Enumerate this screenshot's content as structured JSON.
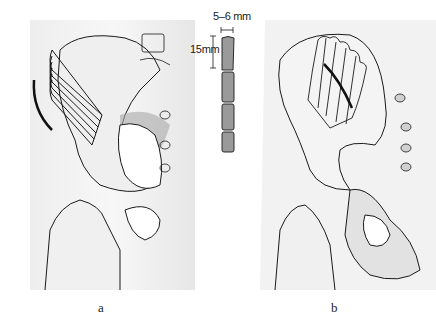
{
  "figure": {
    "panels": [
      {
        "id": "a",
        "label": "a",
        "description": "Posterior view of pelvis with curved strip graft cuts on iliac wing and skin incision"
      },
      {
        "id": "b",
        "label": "b",
        "description": "Lateral view of pelvis with longitudinal strip cuts and crossing line on iliac wing"
      }
    ],
    "dimensions": {
      "width_label": "5–6 mm",
      "height_label": "15mm"
    },
    "colors": {
      "line": "#1a1a1a",
      "shade": "#b8b8b8",
      "background": "#ffffff"
    }
  }
}
